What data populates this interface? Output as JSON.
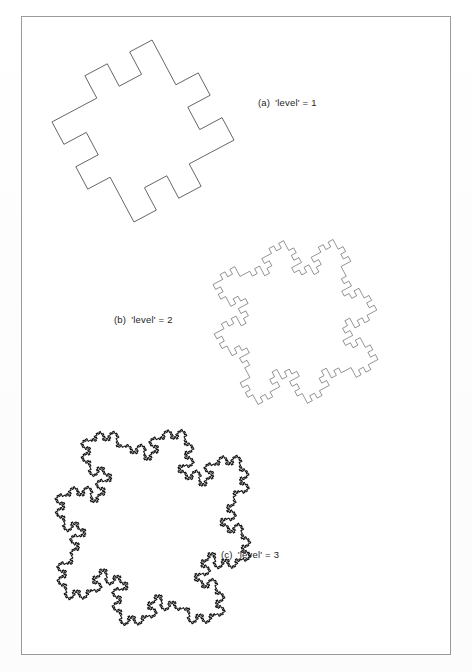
{
  "page": {
    "width": 472,
    "height": 672,
    "background_color": "#ffffff",
    "frame": {
      "name": "figure-border",
      "x": 21,
      "y": 16,
      "width": 430,
      "height": 639,
      "stroke_color": "#9a9a9a",
      "stroke_width": 1
    }
  },
  "figure": {
    "type": "fractal-curve-series",
    "curve_name": "quadratic Koch island",
    "panels": [
      {
        "id": "a",
        "index_label": "(a)",
        "caption": "'level' = 1",
        "level": 1,
        "stroke_color": "#555555",
        "stroke_width": 0.9,
        "fill": "none",
        "bbox": {
          "x": 46,
          "y": 40,
          "width": 194,
          "height": 182
        },
        "segments": 32
      },
      {
        "id": "b",
        "index_label": "(b)",
        "caption": "'level' = 2",
        "level": 2,
        "stroke_color": "#3a3a3a",
        "stroke_width": 0.55,
        "fill": "none",
        "bbox": {
          "x": 213,
          "y": 229,
          "width": 165,
          "height": 186
        },
        "segments": 256
      },
      {
        "id": "c",
        "index_label": "(c)",
        "caption": "'level' = 3",
        "level": 3,
        "stroke_color": "#111111",
        "stroke_width": 1.05,
        "fill": "none",
        "bbox": {
          "x": 55,
          "y": 429,
          "width": 196,
          "height": 197
        },
        "segments": 2048
      }
    ],
    "generator": {
      "description": "8-segment Minkowski sausage generator applied to each side of a square",
      "turns": [
        0,
        90,
        -90,
        -90,
        90,
        90,
        0,
        -90
      ],
      "base_shape": "square",
      "base_turn": 90,
      "rotation_deg": -28
    }
  },
  "captions": {
    "a": {
      "index": "(a)",
      "text": "'level' = 1"
    },
    "b": {
      "index": "(b)",
      "text": "'level' = 2"
    },
    "c": {
      "index": "(c)",
      "text": "'level' = 3"
    }
  }
}
